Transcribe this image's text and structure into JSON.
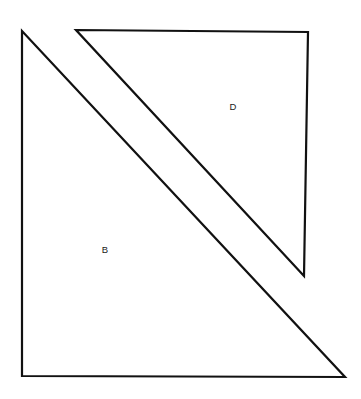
{
  "canvas": {
    "width": 361,
    "height": 399,
    "background_color": "#ffffff",
    "stroke_color": "#111111",
    "stroke_width": 2.2
  },
  "figure": {
    "kind": "line-drawing",
    "shapes": [
      {
        "id": "triangle-b",
        "label": "B",
        "points": "22,31 22,376 345,377",
        "label_x": 105,
        "label_y": 250
      },
      {
        "id": "triangle-d",
        "label": "D",
        "points": "76,30 308,32 304,276",
        "label_x": 233,
        "label_y": 107
      }
    ]
  },
  "labels": {
    "b": "B",
    "d": "D"
  }
}
